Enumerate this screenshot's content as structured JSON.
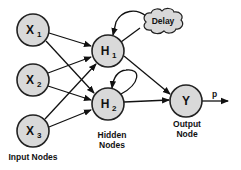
{
  "diagram": {
    "nodes": [
      {
        "id": "x1",
        "main": "X",
        "sub": "1",
        "cx": 33,
        "cy": 30
      },
      {
        "id": "x2",
        "main": "X",
        "sub": "2",
        "cx": 33,
        "cy": 80
      },
      {
        "id": "x3",
        "main": "X",
        "sub": "3",
        "cx": 33,
        "cy": 131
      },
      {
        "id": "h1",
        "main": "H",
        "sub": "1",
        "cx": 108,
        "cy": 51
      },
      {
        "id": "h2",
        "main": "H",
        "sub": "2",
        "cx": 108,
        "cy": 104
      },
      {
        "id": "y",
        "main": "Y",
        "sub": "",
        "cx": 186,
        "cy": 101
      }
    ],
    "delay_label": "Delay",
    "output_label": "p",
    "captions": {
      "input": "Input Nodes",
      "hidden_line1": "Hidden",
      "hidden_line2": "Nodes",
      "output_line1": "Output",
      "output_line2": "Node"
    },
    "colors": {
      "node_fill": "#d9d9d9",
      "stroke": "#222222"
    }
  }
}
